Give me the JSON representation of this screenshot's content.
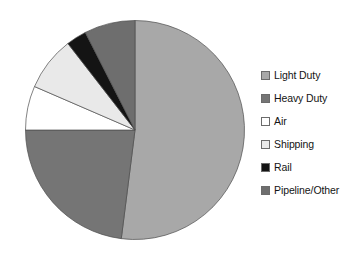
{
  "chart_data": {
    "type": "pie",
    "title": "",
    "subtitle": "",
    "xlabel": "",
    "ylabel": "",
    "grid": false,
    "legend_position": "right",
    "start_angle_deg": 0,
    "direction": "clockwise",
    "categories": [
      "Light Duty",
      "Heavy Duty",
      "Air",
      "Shipping",
      "Rail",
      "Pipeline/Other"
    ],
    "values": [
      52.0,
      23.0,
      6.5,
      8.0,
      3.0,
      7.5
    ],
    "units": "percent",
    "slices": [
      {
        "label": "Light Duty",
        "value": 52.0,
        "color": "#a8a8a8",
        "start_deg": 0.0,
        "end_deg": 187.2
      },
      {
        "label": "Heavy Duty",
        "value": 23.0,
        "color": "#757575",
        "start_deg": 187.2,
        "end_deg": 270.0
      },
      {
        "label": "Air",
        "value": 6.5,
        "color": "#ffffff",
        "start_deg": 270.0,
        "end_deg": 293.4
      },
      {
        "label": "Shipping",
        "value": 8.0,
        "color": "#e9e9e9",
        "start_deg": 293.4,
        "end_deg": 322.2
      },
      {
        "label": "Rail",
        "value": 3.0,
        "color": "#141414",
        "start_deg": 322.2,
        "end_deg": 333.0
      },
      {
        "label": "Pipeline/Other",
        "value": 7.5,
        "color": "#6e6e6e",
        "start_deg": 333.0,
        "end_deg": 360.0
      }
    ]
  },
  "legend": {
    "items": [
      {
        "label": "Light Duty",
        "color": "#a8a8a8",
        "swatch_name": "legend-swatch-light-duty"
      },
      {
        "label": "Heavy Duty",
        "color": "#757575",
        "swatch_name": "legend-swatch-heavy-duty"
      },
      {
        "label": "Air",
        "color": "#ffffff",
        "swatch_name": "legend-swatch-air"
      },
      {
        "label": "Shipping",
        "color": "#e9e9e9",
        "swatch_name": "legend-swatch-shipping"
      },
      {
        "label": "Rail",
        "color": "#141414",
        "swatch_name": "legend-swatch-rail"
      },
      {
        "label": "Pipeline/Other",
        "color": "#6e6e6e",
        "swatch_name": "legend-swatch-pipeline-other"
      }
    ]
  },
  "figure": {
    "background": "#ffffff",
    "outline_color": "#4d4d4d"
  }
}
